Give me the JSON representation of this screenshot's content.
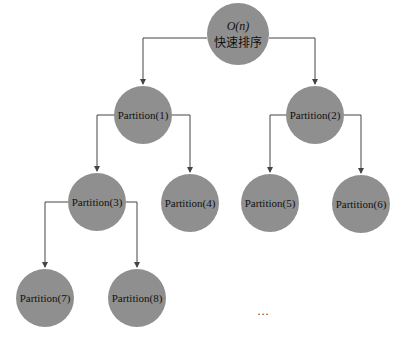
{
  "colors": {
    "node_fill": "#8f8f8f",
    "edge": "#444444",
    "background": "#ffffff"
  },
  "root": {
    "line1": "O(n)",
    "line2": "快速排序"
  },
  "nodes": [
    {
      "id": "p1",
      "label": "Partition(1)"
    },
    {
      "id": "p2",
      "label": "Partition(2)"
    },
    {
      "id": "p3",
      "label": "Partition(3)"
    },
    {
      "id": "p4",
      "label": "Partition(4)"
    },
    {
      "id": "p5",
      "label": "Partition(5)"
    },
    {
      "id": "p6",
      "label": "Partition(6)"
    },
    {
      "id": "p7",
      "label": "Partition(7)"
    },
    {
      "id": "p8",
      "label": "Partition(8)"
    }
  ],
  "edges": [
    [
      "root",
      "p1"
    ],
    [
      "root",
      "p2"
    ],
    [
      "p1",
      "p3"
    ],
    [
      "p1",
      "p4"
    ],
    [
      "p2",
      "p5"
    ],
    [
      "p2",
      "p6"
    ],
    [
      "p3",
      "p7"
    ],
    [
      "p3",
      "p8"
    ]
  ],
  "continuation": "···"
}
